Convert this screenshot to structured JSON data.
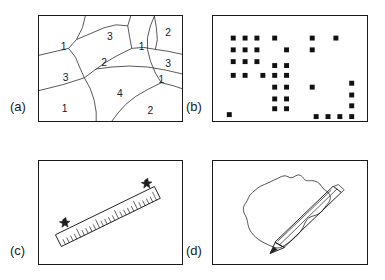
{
  "figure": {
    "width": 385,
    "height": 280,
    "background": "#ffffff",
    "ink_color": "#1a1a1a"
  },
  "panels": [
    {
      "id": "a",
      "label": "(a)",
      "caption_subject": "voronoi-region-map-with-labels",
      "frame": {
        "x": 38,
        "y": 15,
        "w": 145,
        "h": 107
      },
      "label_pos": {
        "x": 10,
        "y": 107
      },
      "region_numbers": [
        {
          "value": "1",
          "x": 25,
          "y": 32
        },
        {
          "value": "3",
          "x": 72,
          "y": 22
        },
        {
          "value": "2",
          "x": 66,
          "y": 48
        },
        {
          "value": "1",
          "x": 104,
          "y": 32
        },
        {
          "value": "2",
          "x": 128,
          "y": 18
        },
        {
          "value": "3",
          "x": 129,
          "y": 49
        },
        {
          "value": "3",
          "x": 27,
          "y": 63
        },
        {
          "value": "4",
          "x": 82,
          "y": 80
        },
        {
          "value": "1",
          "x": 124,
          "y": 68
        },
        {
          "value": "1",
          "x": 26,
          "y": 95
        },
        {
          "value": "2",
          "x": 113,
          "y": 97
        }
      ]
    },
    {
      "id": "b",
      "label": "(b)",
      "caption_subject": "scattered-square-markers-grid",
      "frame": {
        "x": 212,
        "y": 15,
        "w": 156,
        "h": 107
      },
      "label_pos": {
        "x": 186,
        "y": 107
      },
      "marker_size": 5,
      "marker_color": "#111111",
      "markers": [
        {
          "x": 18,
          "y": 20
        },
        {
          "x": 30,
          "y": 20
        },
        {
          "x": 42,
          "y": 20
        },
        {
          "x": 60,
          "y": 20
        },
        {
          "x": 98,
          "y": 20
        },
        {
          "x": 122,
          "y": 20
        },
        {
          "x": 18,
          "y": 32
        },
        {
          "x": 30,
          "y": 32
        },
        {
          "x": 42,
          "y": 32
        },
        {
          "x": 72,
          "y": 32
        },
        {
          "x": 98,
          "y": 32
        },
        {
          "x": 18,
          "y": 44
        },
        {
          "x": 30,
          "y": 44
        },
        {
          "x": 42,
          "y": 44
        },
        {
          "x": 60,
          "y": 48
        },
        {
          "x": 72,
          "y": 48
        },
        {
          "x": 18,
          "y": 58
        },
        {
          "x": 30,
          "y": 58
        },
        {
          "x": 48,
          "y": 58
        },
        {
          "x": 60,
          "y": 58
        },
        {
          "x": 72,
          "y": 58
        },
        {
          "x": 60,
          "y": 70
        },
        {
          "x": 72,
          "y": 70
        },
        {
          "x": 98,
          "y": 70
        },
        {
          "x": 138,
          "y": 66
        },
        {
          "x": 60,
          "y": 82
        },
        {
          "x": 72,
          "y": 82
        },
        {
          "x": 138,
          "y": 78
        },
        {
          "x": 60,
          "y": 92
        },
        {
          "x": 72,
          "y": 92
        },
        {
          "x": 138,
          "y": 89
        },
        {
          "x": 14,
          "y": 98
        },
        {
          "x": 102,
          "y": 100
        },
        {
          "x": 114,
          "y": 100
        },
        {
          "x": 126,
          "y": 100
        },
        {
          "x": 138,
          "y": 100
        }
      ]
    },
    {
      "id": "c",
      "label": "(c)",
      "caption_subject": "tilted-ruler-with-two-star-marks",
      "frame": {
        "x": 38,
        "y": 160,
        "w": 145,
        "h": 105
      },
      "label_pos": {
        "x": 10,
        "y": 250
      },
      "ruler": {
        "tick_count": 26,
        "star_marks": 2
      }
    },
    {
      "id": "d",
      "label": "(d)",
      "caption_subject": "freehand-closed-outline-drawn-with-pencil",
      "frame": {
        "x": 212,
        "y": 160,
        "w": 156,
        "h": 105
      },
      "label_pos": {
        "x": 186,
        "y": 250
      }
    }
  ]
}
